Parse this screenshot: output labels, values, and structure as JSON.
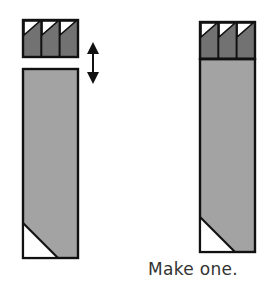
{
  "caption": "Make one.",
  "colors": {
    "outline": "#111111",
    "dark_fill": "#727272",
    "body_fill": "#a3a3a3",
    "corner_fill": "#ffffff",
    "caption_text": "#333333"
  },
  "figures": [
    {
      "id": "before-assembly",
      "top_block": {
        "cells": 3,
        "x": 23,
        "y": 20,
        "w": 55,
        "h": 37
      },
      "body": {
        "x": 23,
        "y": 69,
        "w": 55,
        "h": 189
      },
      "move_arrow": {
        "direction": "vertical-double",
        "x": 93,
        "y1": 42,
        "y2": 84
      }
    },
    {
      "id": "after-assembly",
      "top_block": {
        "cells": 3,
        "x": 200,
        "y": 22,
        "w": 55,
        "h": 37
      },
      "body": {
        "x": 200,
        "y": 59,
        "w": 55,
        "h": 193
      }
    }
  ]
}
